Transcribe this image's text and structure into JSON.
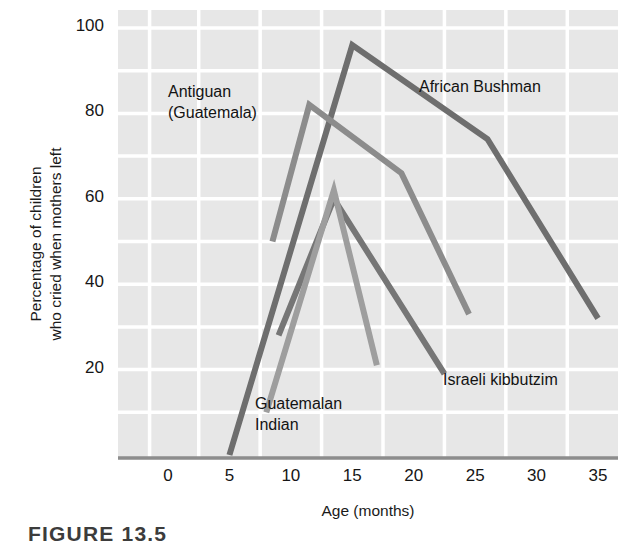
{
  "figure": {
    "caption": "FIGURE 13.5",
    "background_color": "#ffffff",
    "plot_background_color": "#e7e7e7",
    "gridline_color": "#ffffff",
    "axis_color": "#8d8d8d"
  },
  "chart_data": {
    "type": "line",
    "title": "",
    "xlabel": "Age (months)",
    "ylabel": "Percentage of children\nwho cried when mothers left",
    "xlim": [
      -2,
      35
    ],
    "ylim": [
      0,
      104
    ],
    "xticks": [
      0,
      5,
      10,
      15,
      20,
      25,
      30,
      35
    ],
    "xtick_labels": [
      "0",
      "5",
      "10",
      "15",
      "20",
      "25",
      "30",
      "35"
    ],
    "yticks": [
      20,
      40,
      60,
      80,
      100
    ],
    "ytick_labels": [
      "20",
      "40",
      "60",
      "80",
      "100"
    ],
    "y_gridlines": [
      10,
      20,
      30,
      40,
      50,
      60,
      70,
      80,
      90,
      100
    ],
    "x_gridlines": [
      -1.5,
      2.5,
      7.5,
      12.5,
      17.5,
      22.5,
      27.5,
      32.5
    ],
    "grid": true,
    "legend_position": "inline-annotations",
    "series": [
      {
        "name": "African Bushman",
        "color": "#6e6e6e",
        "width": 6,
        "x": [
          5,
          15,
          26,
          35
        ],
        "y": [
          0,
          96,
          74,
          32
        ]
      },
      {
        "name": "Antiguan (Guatemala)",
        "color": "#8c8c8c",
        "width": 6,
        "x": [
          8.5,
          11.5,
          19,
          24.5
        ],
        "y": [
          50,
          82,
          66,
          33
        ]
      },
      {
        "name": "Israeli kibbutzim",
        "color": "#767676",
        "width": 6,
        "x": [
          9,
          13.5,
          22.5
        ],
        "y": [
          28,
          60,
          19
        ]
      },
      {
        "name": "Guatemalan Indian",
        "color": "#9e9e9e",
        "width": 6,
        "x": [
          8,
          13.5,
          17
        ],
        "y": [
          10,
          62,
          21
        ]
      }
    ],
    "annotations": [
      {
        "id": "antiguan",
        "text": "Antiguan\n(Guatemala)",
        "x_px": 168,
        "y_px": 81
      },
      {
        "id": "african-bushman",
        "text": "African Bushman",
        "x_px": 419,
        "y_px": 76
      },
      {
        "id": "israeli-kibbutzim",
        "text": "Israeli kibbutzim",
        "x_px": 443,
        "y_px": 369
      },
      {
        "id": "guatemalan-indian",
        "text": "Guatemalan\nIndian",
        "x_px": 255,
        "y_px": 393
      }
    ]
  }
}
